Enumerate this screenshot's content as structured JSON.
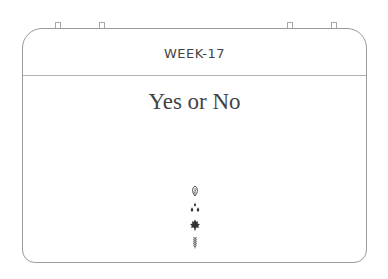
{
  "card": {
    "week_label": "WEEK-17",
    "title": "Yes or No"
  },
  "icons": [
    {
      "name": "leaf-outline-icon"
    },
    {
      "name": "droplets-icon"
    },
    {
      "name": "maple-leaf-icon"
    },
    {
      "name": "wheat-icon"
    }
  ],
  "colors": {
    "border": "#9a9a9a",
    "text": "#444444",
    "icon": "#333333"
  }
}
